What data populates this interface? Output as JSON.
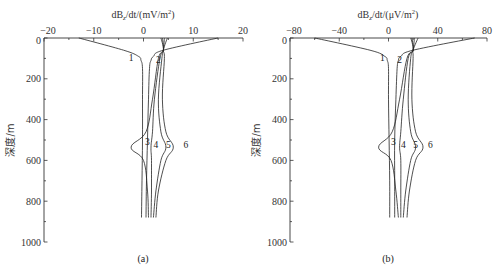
{
  "chart_data": [
    {
      "panel": "(a)",
      "type": "line",
      "title": "",
      "xlabel": "dBz/dt/(mV/m²)",
      "xlabel_parts": {
        "prefix": "dB",
        "sub": "z",
        "suffix": "/dt/(mV/m",
        "sup": "2",
        "close": ")"
      },
      "ylabel": "深度/m",
      "xlim": [
        -20,
        20
      ],
      "ylim": [
        0,
        1000
      ],
      "y_inverted": true,
      "x_ticks": [
        -20,
        -10,
        0,
        10,
        20
      ],
      "y_ticks": [
        0,
        200,
        400,
        600,
        800,
        1000
      ],
      "grid": false,
      "series": [
        {
          "name": "1",
          "depth": [
            0,
            60,
            90,
            110,
            150,
            300,
            500,
            700,
            880
          ],
          "values": [
            -13,
            -4,
            -1,
            -0.5,
            -0.2,
            -0.2,
            -0.2,
            -0.3,
            -0.4
          ]
        },
        {
          "name": "2",
          "depth": [
            0,
            60,
            90,
            110,
            150,
            300,
            500,
            700,
            880
          ],
          "values": [
            15,
            4,
            2,
            1.5,
            1.2,
            1.0,
            0.8,
            0.6,
            0.5
          ]
        },
        {
          "name": "3",
          "depth": [
            0,
            60,
            100,
            300,
            460,
            535,
            600,
            750,
            880
          ],
          "values": [
            3.5,
            4,
            3.0,
            1.8,
            0.5,
            -2.5,
            0,
            0.8,
            1.0
          ]
        },
        {
          "name": "4",
          "depth": [
            0,
            60,
            100,
            300,
            460,
            535,
            600,
            750,
            880
          ],
          "values": [
            3.8,
            4,
            3.3,
            2.2,
            1.8,
            1.5,
            1.6,
            1.6,
            1.5
          ]
        },
        {
          "name": "5",
          "depth": [
            0,
            60,
            100,
            300,
            460,
            535,
            600,
            750,
            880
          ],
          "values": [
            4.2,
            4,
            3.7,
            3.0,
            3.5,
            4.5,
            3.5,
            2.5,
            2.0
          ]
        },
        {
          "name": "6",
          "depth": [
            0,
            60,
            100,
            300,
            460,
            535,
            600,
            750,
            880
          ],
          "values": [
            4.8,
            4,
            4.2,
            3.8,
            4.5,
            6.0,
            4.5,
            3.0,
            2.5
          ]
        }
      ],
      "curve_labels": [
        {
          "text": "1",
          "x": -2.5,
          "depth": 100
        },
        {
          "text": "2",
          "x": 3,
          "depth": 110
        },
        {
          "text": "3",
          "x": 0.8,
          "depth": 510
        },
        {
          "text": "4",
          "x": 2.5,
          "depth": 525
        },
        {
          "text": "5",
          "x": 5,
          "depth": 525
        },
        {
          "text": "6",
          "x": 8.5,
          "depth": 525
        }
      ]
    },
    {
      "panel": "(b)",
      "type": "line",
      "title": "",
      "xlabel": "dBz/dt/(μV/m²)",
      "xlabel_parts": {
        "prefix": "dB",
        "sub": "z",
        "suffix": "/dt/(μV/m",
        "sup": "2",
        "close": ")"
      },
      "ylabel": "深度/m",
      "xlim": [
        -80,
        80
      ],
      "ylim": [
        0,
        1000
      ],
      "y_inverted": true,
      "x_ticks": [
        -80,
        -40,
        0,
        40,
        80
      ],
      "y_ticks": [
        0,
        200,
        400,
        600,
        800,
        1000
      ],
      "grid": false,
      "series": [
        {
          "name": "1",
          "depth": [
            0,
            60,
            90,
            110,
            150,
            300,
            500,
            700,
            880
          ],
          "values": [
            -60,
            -15,
            -3,
            -1,
            0,
            0,
            0.5,
            1,
            1
          ]
        },
        {
          "name": "2",
          "depth": [
            0,
            60,
            90,
            110,
            150,
            300,
            500,
            700,
            880
          ],
          "values": [
            70,
            20,
            10,
            8,
            7,
            6,
            5,
            5,
            5
          ]
        },
        {
          "name": "3",
          "depth": [
            0,
            60,
            100,
            300,
            460,
            535,
            600,
            750,
            880
          ],
          "values": [
            18,
            20,
            15,
            9,
            3,
            -8,
            2,
            6,
            8
          ]
        },
        {
          "name": "4",
          "depth": [
            0,
            60,
            100,
            300,
            460,
            535,
            600,
            750,
            880
          ],
          "values": [
            19,
            20,
            16,
            12,
            10,
            9,
            10,
            10,
            10
          ]
        },
        {
          "name": "5",
          "depth": [
            0,
            60,
            100,
            300,
            460,
            535,
            600,
            750,
            880
          ],
          "values": [
            21,
            20,
            18,
            16,
            18,
            22,
            18,
            14,
            12
          ]
        },
        {
          "name": "6",
          "depth": [
            0,
            60,
            100,
            300,
            460,
            535,
            600,
            750,
            880
          ],
          "values": [
            24,
            20,
            20,
            19,
            22,
            28,
            22,
            17,
            15
          ]
        }
      ],
      "curve_labels": [
        {
          "text": "1",
          "x": -5,
          "depth": 100
        },
        {
          "text": "2",
          "x": 9,
          "depth": 110
        },
        {
          "text": "3",
          "x": 4,
          "depth": 510
        },
        {
          "text": "4",
          "x": 12,
          "depth": 525
        },
        {
          "text": "5",
          "x": 22,
          "depth": 525
        },
        {
          "text": "6",
          "x": 34,
          "depth": 525
        }
      ]
    }
  ],
  "panels": [
    {
      "caption": "(a)",
      "ylabel": "深度/m",
      "xlabel_prefix": "dB",
      "xlabel_sub": "z",
      "xlabel_suffix": "/dt/(mV/m",
      "xlabel_sup": "2",
      "xlabel_close": ")"
    },
    {
      "caption": "(b)",
      "ylabel": "深度/m",
      "xlabel_prefix": "dB",
      "xlabel_sub": "z",
      "xlabel_suffix": "/dt/(μV/m",
      "xlabel_sup": "2",
      "xlabel_close": ")"
    }
  ],
  "colors": {
    "axis": "#333333",
    "curve": "#222222",
    "background": "#ffffff"
  }
}
